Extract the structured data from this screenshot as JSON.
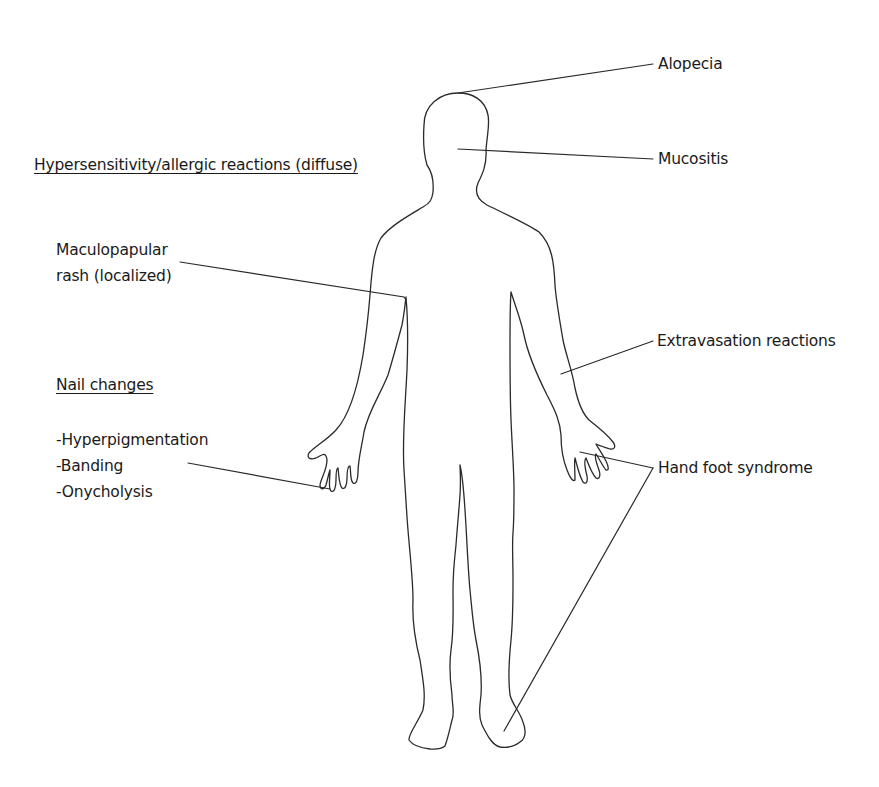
{
  "diagram": {
    "type": "anatomical-annotation",
    "stroke_color": "#2a2a2a",
    "background": "#ffffff",
    "labels": {
      "alopecia": "Alopecia",
      "mucositis": "Mucositis",
      "hypersensitivity": "Hypersensitivity/allergic reactions (diffuse)",
      "maculopapular_line1": "Maculopapular",
      "maculopapular_line2": "rash (localized)",
      "extravasation": "Extravasation reactions",
      "nail_changes_heading": "Nail changes",
      "nail_items": [
        "-Hyperpigmentation",
        "-Banding",
        "-Onycholysis"
      ],
      "hand_foot": "Hand foot syndrome"
    },
    "leader_lines": [
      {
        "label": "Alopecia",
        "from": [
          653,
          64
        ],
        "to": [
          458,
          93
        ]
      },
      {
        "label": "Mucositis",
        "from": [
          653,
          159
        ],
        "to": [
          458,
          149
        ]
      },
      {
        "label": "Maculopapular rash (localized)",
        "from": [
          180,
          262
        ],
        "to": [
          405,
          297
        ]
      },
      {
        "label": "Extravasation reactions",
        "from": [
          653,
          341
        ],
        "to": [
          561,
          374
        ]
      },
      {
        "label": "Nail changes",
        "from": [
          188,
          463
        ],
        "to": [
          330,
          489
        ]
      },
      {
        "label": "Hand foot syndrome (hand)",
        "from": [
          653,
          468
        ],
        "to": [
          578,
          453
        ]
      },
      {
        "label": "Hand foot syndrome (foot)",
        "from": [
          653,
          468
        ],
        "to": [
          503,
          731
        ]
      }
    ]
  }
}
